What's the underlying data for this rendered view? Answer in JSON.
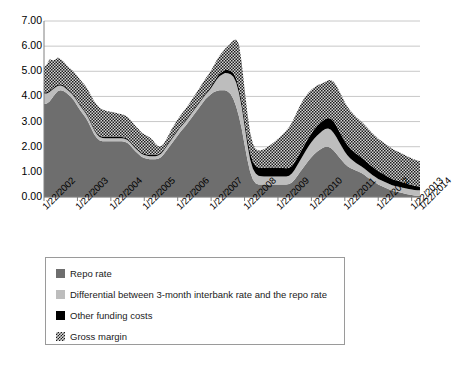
{
  "chart_data": {
    "type": "area",
    "title": "",
    "subtitle": "",
    "xlabel": "",
    "ylabel": "",
    "stacked": true,
    "grid": true,
    "legend_position": "bottom",
    "ylim": [
      0,
      7
    ],
    "ytick_labels": [
      "0.00",
      "1.00",
      "2.00",
      "3.00",
      "4.00",
      "5.00",
      "6.00",
      "7.00"
    ],
    "ytick_values": [
      0,
      1,
      2,
      3,
      4,
      5,
      6,
      7
    ],
    "xtick_labels": [
      "1/22/2002",
      "1/22/2003",
      "1/22/2004",
      "1/22/2005",
      "1/22/2006",
      "1/22/2007",
      "1/22/2008",
      "1/22/2009",
      "1/22/2010",
      "1/22/2011",
      "1/22/2012",
      "1/22/2013",
      "1/22/2014"
    ],
    "x_start": "1/22/2002",
    "x_end": "10/22/2014",
    "colors": {
      "repo_rate": "#6e6e6e",
      "differential": "#bdbdbd",
      "other_funding_costs": "#000000",
      "gross_margin": "#2b2b2b",
      "gridline": "#c8c8c8",
      "axis": "#808080"
    },
    "series": [
      {
        "name": "Repo rate",
        "color": "#6e6e6e",
        "values": [
          3.7,
          3.72,
          3.8,
          3.95,
          4.1,
          4.22,
          4.25,
          4.22,
          4.15,
          4.05,
          3.95,
          3.8,
          3.62,
          3.45,
          3.3,
          3.15,
          2.95,
          2.72,
          2.5,
          2.35,
          2.25,
          2.22,
          2.22,
          2.22,
          2.22,
          2.22,
          2.22,
          2.22,
          2.22,
          2.2,
          2.15,
          2.05,
          1.92,
          1.8,
          1.7,
          1.6,
          1.55,
          1.52,
          1.5,
          1.5,
          1.5,
          1.52,
          1.58,
          1.7,
          1.85,
          2.0,
          2.15,
          2.3,
          2.45,
          2.6,
          2.72,
          2.85,
          3.0,
          3.15,
          3.3,
          3.45,
          3.6,
          3.75,
          3.9,
          4.0,
          4.1,
          4.18,
          4.22,
          4.25,
          4.25,
          4.25,
          4.2,
          4.1,
          3.9,
          3.6,
          3.2,
          2.7,
          2.1,
          1.5,
          1.0,
          0.7,
          0.55,
          0.5,
          0.5,
          0.5,
          0.5,
          0.5,
          0.5,
          0.5,
          0.5,
          0.5,
          0.5,
          0.5,
          0.52,
          0.58,
          0.7,
          0.85,
          1.0,
          1.15,
          1.3,
          1.45,
          1.58,
          1.7,
          1.8,
          1.88,
          1.95,
          2.0,
          2.0,
          1.95,
          1.85,
          1.72,
          1.58,
          1.45,
          1.32,
          1.22,
          1.15,
          1.1,
          1.05,
          1.0,
          0.95,
          0.88,
          0.8,
          0.72,
          0.65,
          0.58,
          0.5,
          0.45,
          0.4,
          0.35,
          0.3,
          0.25,
          0.22,
          0.2,
          0.18,
          0.15,
          0.12,
          0.1,
          0.08,
          0.06,
          0.05,
          0.05
        ]
      },
      {
        "name": "Differential between 3-month interbank rate and the repo rate",
        "color": "#bdbdbd",
        "values": [
          0.42,
          0.4,
          0.38,
          0.32,
          0.26,
          0.2,
          0.18,
          0.17,
          0.16,
          0.16,
          0.16,
          0.17,
          0.18,
          0.18,
          0.18,
          0.18,
          0.18,
          0.17,
          0.16,
          0.15,
          0.14,
          0.13,
          0.12,
          0.12,
          0.12,
          0.12,
          0.12,
          0.12,
          0.12,
          0.12,
          0.12,
          0.12,
          0.12,
          0.12,
          0.12,
          0.12,
          0.12,
          0.12,
          0.12,
          0.12,
          0.12,
          0.13,
          0.14,
          0.15,
          0.16,
          0.17,
          0.18,
          0.18,
          0.18,
          0.18,
          0.18,
          0.18,
          0.18,
          0.18,
          0.18,
          0.18,
          0.18,
          0.18,
          0.18,
          0.2,
          0.24,
          0.32,
          0.45,
          0.55,
          0.62,
          0.68,
          0.72,
          0.78,
          0.88,
          0.95,
          0.95,
          0.88,
          0.75,
          0.62,
          0.5,
          0.42,
          0.38,
          0.35,
          0.33,
          0.32,
          0.32,
          0.32,
          0.32,
          0.32,
          0.32,
          0.32,
          0.32,
          0.32,
          0.33,
          0.35,
          0.38,
          0.42,
          0.46,
          0.5,
          0.54,
          0.57,
          0.6,
          0.62,
          0.64,
          0.66,
          0.68,
          0.7,
          0.72,
          0.72,
          0.7,
          0.66,
          0.6,
          0.54,
          0.48,
          0.43,
          0.38,
          0.34,
          0.3,
          0.28,
          0.26,
          0.25,
          0.24,
          0.23,
          0.22,
          0.22,
          0.22,
          0.22,
          0.22,
          0.22,
          0.22,
          0.22,
          0.22,
          0.22,
          0.22,
          0.22,
          0.22,
          0.22,
          0.22,
          0.22,
          0.22,
          0.22
        ]
      },
      {
        "name": "Other funding costs",
        "color": "#000000",
        "values": [
          0.05,
          0.05,
          0.05,
          0.05,
          0.05,
          0.05,
          0.05,
          0.05,
          0.05,
          0.05,
          0.05,
          0.05,
          0.05,
          0.05,
          0.05,
          0.05,
          0.05,
          0.05,
          0.05,
          0.05,
          0.05,
          0.05,
          0.05,
          0.05,
          0.05,
          0.05,
          0.05,
          0.05,
          0.05,
          0.05,
          0.05,
          0.05,
          0.05,
          0.05,
          0.05,
          0.05,
          0.05,
          0.05,
          0.05,
          0.05,
          0.05,
          0.05,
          0.05,
          0.05,
          0.05,
          0.05,
          0.05,
          0.05,
          0.05,
          0.05,
          0.05,
          0.05,
          0.05,
          0.05,
          0.05,
          0.05,
          0.05,
          0.05,
          0.05,
          0.06,
          0.07,
          0.08,
          0.09,
          0.1,
          0.11,
          0.12,
          0.13,
          0.14,
          0.15,
          0.16,
          0.18,
          0.2,
          0.22,
          0.24,
          0.26,
          0.28,
          0.3,
          0.32,
          0.33,
          0.34,
          0.35,
          0.35,
          0.35,
          0.35,
          0.35,
          0.34,
          0.33,
          0.32,
          0.31,
          0.3,
          0.3,
          0.3,
          0.31,
          0.32,
          0.33,
          0.34,
          0.35,
          0.36,
          0.37,
          0.38,
          0.39,
          0.4,
          0.42,
          0.44,
          0.45,
          0.45,
          0.44,
          0.43,
          0.42,
          0.41,
          0.4,
          0.39,
          0.38,
          0.37,
          0.36,
          0.35,
          0.34,
          0.33,
          0.32,
          0.31,
          0.3,
          0.29,
          0.28,
          0.27,
          0.26,
          0.25,
          0.24,
          0.23,
          0.22,
          0.21,
          0.2,
          0.19,
          0.18,
          0.17,
          0.16,
          0.15
        ]
      },
      {
        "name": "Gross margin",
        "color": "#2b2b2b",
        "values": [
          0.98,
          1.1,
          1.25,
          1.12,
          1.05,
          1.08,
          1.0,
          0.95,
          0.9,
          0.88,
          0.9,
          0.92,
          0.95,
          0.98,
          1.0,
          1.02,
          1.05,
          1.08,
          1.1,
          1.12,
          1.1,
          1.08,
          1.05,
          1.02,
          1.0,
          0.98,
          0.95,
          0.92,
          0.9,
          0.88,
          0.86,
          0.85,
          0.84,
          0.83,
          0.82,
          0.8,
          0.78,
          0.75,
          0.7,
          0.6,
          0.45,
          0.32,
          0.25,
          0.22,
          0.25,
          0.3,
          0.35,
          0.38,
          0.4,
          0.42,
          0.44,
          0.45,
          0.46,
          0.48,
          0.5,
          0.52,
          0.54,
          0.56,
          0.58,
          0.6,
          0.62,
          0.65,
          0.68,
          0.72,
          0.78,
          0.85,
          0.95,
          1.1,
          1.3,
          1.55,
          1.75,
          1.55,
          1.25,
          1.0,
          0.82,
          0.72,
          0.68,
          0.68,
          0.7,
          0.74,
          0.8,
          0.88,
          0.96,
          1.05,
          1.15,
          1.26,
          1.38,
          1.5,
          1.62,
          1.72,
          1.8,
          1.85,
          1.88,
          1.88,
          1.85,
          1.8,
          1.74,
          1.68,
          1.62,
          1.56,
          1.5,
          1.48,
          1.5,
          1.54,
          1.58,
          1.6,
          1.6,
          1.58,
          1.55,
          1.52,
          1.5,
          1.48,
          1.46,
          1.44,
          1.42,
          1.4,
          1.38,
          1.36,
          1.34,
          1.32,
          1.3,
          1.28,
          1.26,
          1.24,
          1.22,
          1.2,
          1.18,
          1.16,
          1.14,
          1.12,
          1.1,
          1.08,
          1.06,
          1.04,
          1.02,
          1.0
        ]
      }
    ]
  },
  "legend": {
    "items": [
      {
        "label": "Repo rate",
        "swatch": "sw-repo"
      },
      {
        "label": "Differential between 3-month interbank rate and the repo rate",
        "swatch": "sw-diff"
      },
      {
        "label": "Other funding costs",
        "swatch": "sw-other"
      },
      {
        "label": "Gross margin",
        "swatch": "sw-margin"
      }
    ]
  }
}
